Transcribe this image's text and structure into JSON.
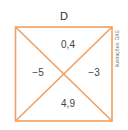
{
  "figure": {
    "title": "D",
    "top_value": "0,4",
    "left_value": "−5",
    "right_value": "−3",
    "bottom_value": "4,9",
    "credit": "Ilustrações: DAE",
    "line_color": "#f0a060"
  }
}
